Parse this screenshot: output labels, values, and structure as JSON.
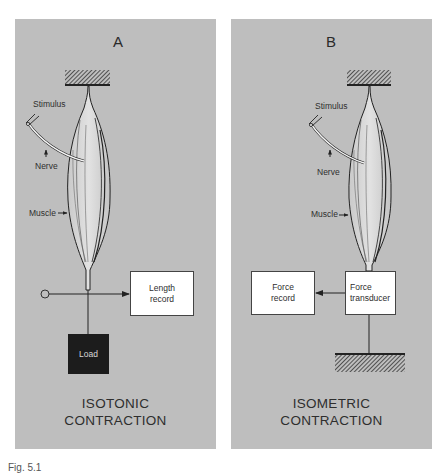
{
  "figure": {
    "panels": [
      {
        "letter": "A",
        "labels": {
          "stimulus": "Stimulus",
          "nerve": "Nerve",
          "muscle": "Muscle"
        },
        "boxes": {
          "length_record": [
            "Length",
            "record"
          ],
          "load": "Load"
        },
        "title": [
          "ISOTONIC",
          "CONTRACTION"
        ]
      },
      {
        "letter": "B",
        "labels": {
          "stimulus": "Stimulus",
          "nerve": "Nerve",
          "muscle": "Muscle"
        },
        "boxes": {
          "force_record": [
            "Force",
            "record"
          ],
          "force_transducer": [
            "Force",
            "transducer"
          ]
        },
        "title": [
          "ISOMETRIC",
          "CONTRACTION"
        ]
      }
    ],
    "caption_partial": "Fig. 5.1"
  },
  "colors": {
    "panel_bg": "#bebebe",
    "text": "#2e2e2e",
    "load_fill": "#1c1c1c",
    "box_fill": "#ffffff"
  }
}
